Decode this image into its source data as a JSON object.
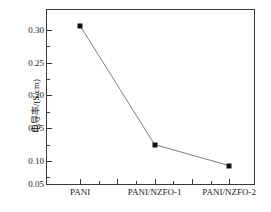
{
  "chart_data": {
    "type": "line",
    "title": "",
    "subtitle": "",
    "xlabel": "",
    "ylabel": "电导率/(S/cm)",
    "categories": [
      "PANI",
      "PANI/NZFO-1",
      "PANI/NZFO-2"
    ],
    "values": [
      0.291,
      0.11,
      0.078
    ],
    "series": [
      {
        "name": "电导率",
        "values": [
          0.291,
          0.11,
          0.078
        ],
        "marker": "filled-square",
        "marker_color": "#111111",
        "line_color": "#111111"
      }
    ],
    "ylim": [
      0.05,
      0.315
    ],
    "ytick_labels": [
      "0.05",
      "0.10",
      "0.15",
      "0.20",
      "0.25",
      "0.30"
    ],
    "ytick_values": [
      0.05,
      0.1,
      0.15,
      0.2,
      0.25,
      0.3
    ],
    "yminor_values": [
      0.075,
      0.125,
      0.175,
      0.225,
      0.275
    ],
    "xtick_positions": [
      0.5,
      1.0,
      1.5,
      2.0,
      2.5
    ],
    "xtick_minor_positions": [
      0.75,
      1.25,
      1.75,
      2.25
    ],
    "xlim": [
      0.25,
      2.75
    ],
    "grid": false,
    "legend": false,
    "legend_position": "none",
    "annotations": []
  },
  "axes": {
    "y_title": "电导率/(S/cm)",
    "y_labels": {
      "t0": "0.30",
      "t1": "0.25",
      "t2": "0.20",
      "t3": "0.15",
      "t4": "0.10",
      "t5": "0.05"
    },
    "x_labels": {
      "c0": "PANI",
      "c1": "PANI/NZFO-1",
      "c2": "PANI/NZFO-2"
    }
  },
  "colors": {
    "frame": "#3a3a3a",
    "marker": "#111111",
    "line": "#111111",
    "background": "#ffffff",
    "text": "#1a1a1a"
  }
}
